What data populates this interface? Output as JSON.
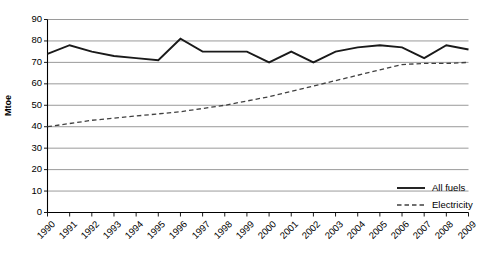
{
  "chart_data": {
    "type": "line",
    "title": "",
    "xlabel": "",
    "ylabel": "Mtoe",
    "ylim": [
      0,
      90
    ],
    "ytick_step": 10,
    "grid": true,
    "grid_axis": "y",
    "legend_position": "bottom-right",
    "categories": [
      "1990",
      "1991",
      "1992",
      "1993",
      "1994",
      "1995",
      "1996",
      "1997",
      "1998",
      "1999",
      "2000",
      "2001",
      "2002",
      "2003",
      "2004",
      "2005",
      "2006",
      "2007",
      "2008",
      "2009"
    ],
    "yticks": [
      "0",
      "10",
      "20",
      "30",
      "40",
      "50",
      "60",
      "70",
      "80",
      "90"
    ],
    "series": [
      {
        "name": "All fuels",
        "style": "solid",
        "color": "#1a1a1a",
        "values": [
          74,
          78,
          75,
          73,
          72,
          71,
          81,
          75,
          75,
          75,
          70,
          75,
          70,
          75,
          77,
          78,
          77,
          72,
          78,
          76
        ]
      },
      {
        "name": "Electricity",
        "style": "dashed",
        "color": "#404040",
        "values": [
          40,
          41.5,
          43,
          44,
          45,
          46,
          47,
          48.5,
          50,
          52,
          54,
          56.5,
          59,
          61.5,
          64,
          66.5,
          69,
          69.5,
          69.5,
          70
        ]
      }
    ]
  },
  "legend": {
    "items": [
      {
        "label": "All fuels",
        "style": "solid"
      },
      {
        "label": "Electricity",
        "style": "dashed"
      }
    ]
  }
}
